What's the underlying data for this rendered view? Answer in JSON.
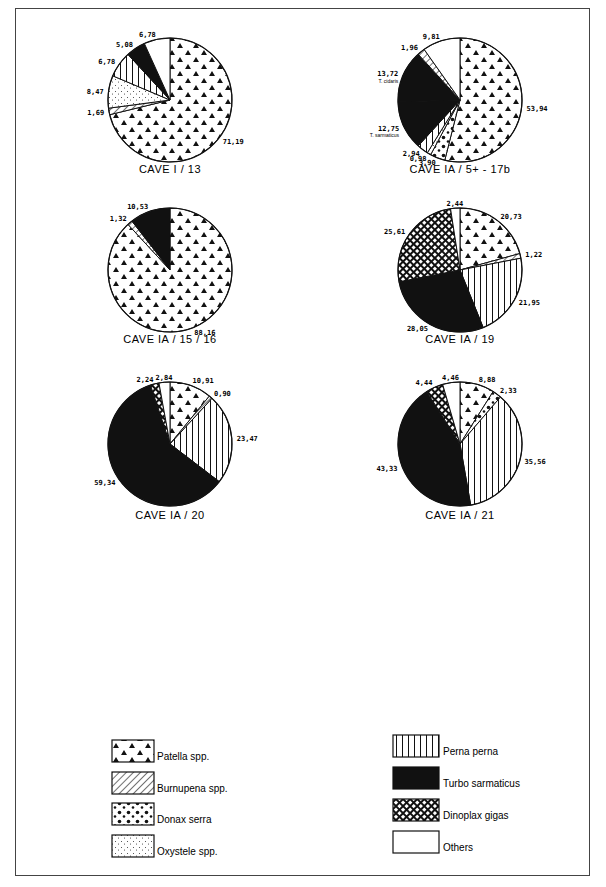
{
  "figure": {
    "legend": [
      {
        "key": "patella",
        "label": "Patella spp."
      },
      {
        "key": "burnupena",
        "label": "Burnupena spp."
      },
      {
        "key": "donax",
        "label": "Donax serra"
      },
      {
        "key": "oxystele",
        "label": "Oxystele spp."
      },
      {
        "key": "perna",
        "label": "Perna perna"
      },
      {
        "key": "turbo",
        "label": "Turbo sarmaticus"
      },
      {
        "key": "dinoplax",
        "label": "Dinoplax gigas"
      },
      {
        "key": "others",
        "label": "Others"
      }
    ]
  },
  "chart_data": [
    {
      "type": "pie",
      "title": "CAVE I / 13",
      "slices": [
        {
          "category": "patella",
          "value": 71.19,
          "label": "71,19"
        },
        {
          "category": "burnupena",
          "value": 1.69,
          "label": "1,69"
        },
        {
          "category": "oxystele",
          "value": 8.47,
          "label": "8,47"
        },
        {
          "category": "perna",
          "value": 6.78,
          "label": "6,78"
        },
        {
          "category": "turbo",
          "value": 5.08,
          "label": "5,08"
        },
        {
          "category": "others",
          "value": 6.78,
          "label": "6,78"
        }
      ]
    },
    {
      "type": "pie",
      "title": "CAVE IA / 5+ - 17b",
      "slices": [
        {
          "category": "patella",
          "value": 53.94,
          "label": "53,94"
        },
        {
          "category": "donax",
          "value": 3.9,
          "label": "3,90"
        },
        {
          "category": "oxystele",
          "value": 0.98,
          "label": "0,98"
        },
        {
          "category": "perna",
          "value": 2.94,
          "label": "2,94"
        },
        {
          "category": "turbo",
          "value": 12.75,
          "label": "12,75",
          "sublabel": "T. sarmaticus"
        },
        {
          "category": "turbo",
          "value": 13.72,
          "label": "13,72",
          "sublabel": "T. cidaris"
        },
        {
          "category": "burnupena",
          "value": 1.96,
          "label": "1,96"
        },
        {
          "category": "others",
          "value": 9.81,
          "label": "9,81"
        }
      ]
    },
    {
      "type": "pie",
      "title": "CAVE IA / 15 / 16",
      "slices": [
        {
          "category": "patella",
          "value": 88.16,
          "label": "88,16"
        },
        {
          "category": "burnupena",
          "value": 1.32,
          "label": "1,32"
        },
        {
          "category": "turbo",
          "value": 10.53,
          "label": "10,53"
        }
      ]
    },
    {
      "type": "pie",
      "title": "CAVE IA / 19",
      "slices": [
        {
          "category": "patella",
          "value": 20.73,
          "label": "20,73"
        },
        {
          "category": "burnupena",
          "value": 1.22,
          "label": "1,22"
        },
        {
          "category": "perna",
          "value": 21.95,
          "label": "21,95"
        },
        {
          "category": "turbo",
          "value": 28.05,
          "label": "28,05"
        },
        {
          "category": "dinoplax",
          "value": 25.61,
          "label": "25,61"
        },
        {
          "category": "others",
          "value": 2.44,
          "label": "2,44"
        }
      ]
    },
    {
      "type": "pie",
      "title": "CAVE IA / 20",
      "slices": [
        {
          "category": "patella",
          "value": 10.91,
          "label": "10,91"
        },
        {
          "category": "burnupena",
          "value": 0.9,
          "label": "0,90"
        },
        {
          "category": "perna",
          "value": 23.47,
          "label": "23,47"
        },
        {
          "category": "turbo",
          "value": 59.34,
          "label": "59,34"
        },
        {
          "category": "dinoplax",
          "value": 2.24,
          "label": "2,24"
        },
        {
          "category": "others",
          "value": 2.84,
          "label": "2,84"
        }
      ]
    },
    {
      "type": "pie",
      "title": "CAVE IA / 21",
      "slices": [
        {
          "category": "patella",
          "value": 8.88,
          "label": "8,88"
        },
        {
          "category": "donax",
          "value": 2.33,
          "label": "2,33"
        },
        {
          "category": "perna",
          "value": 35.56,
          "label": "35,56"
        },
        {
          "category": "turbo",
          "value": 43.33,
          "label": "43,33"
        },
        {
          "category": "dinoplax",
          "value": 4.44,
          "label": "4,44"
        },
        {
          "category": "others",
          "value": 4.46,
          "label": "4,46"
        }
      ]
    }
  ]
}
